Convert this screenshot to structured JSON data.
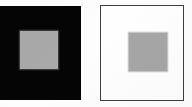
{
  "figure": {
    "caption": "Two identical gray squares shown against a black surround and a white surround.",
    "canvas": {
      "width_px": 192,
      "height_px": 107,
      "background_color": "#fdfdfd"
    }
  },
  "panels": [
    {
      "id": "dark-surround",
      "label": "Gray patch on black surround",
      "surround_color": "#050505",
      "surround_border_color": "none",
      "patch_label": "gray test patch",
      "patch_color": "#a9a9a9",
      "position": {
        "x": 0,
        "y": 6,
        "width": 81,
        "height": 94
      },
      "patch_position": {
        "x": 20,
        "y": 31,
        "width": 38,
        "height": 38
      }
    },
    {
      "id": "light-surround",
      "label": "Gray patch on white surround",
      "surround_color": "#fefefe",
      "surround_border_color": "#3d3d3d",
      "patch_label": "gray test patch",
      "patch_color": "#a6a6a6",
      "position": {
        "x": 100,
        "y": 5,
        "width": 84,
        "height": 96
      },
      "patch_position": {
        "x": 128,
        "y": 32,
        "width": 38,
        "height": 38
      }
    }
  ],
  "colors": {
    "black": "#050505",
    "white": "#fefefe",
    "gray_patch": "#a8a8a8",
    "border": "#3d3d3d",
    "page": "#fdfdfd"
  }
}
